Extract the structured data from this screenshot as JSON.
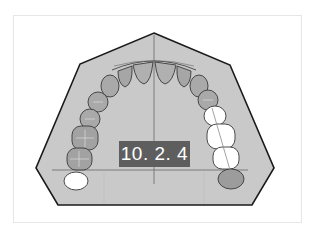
{
  "diagram": {
    "label": "10. 2. 4",
    "colors": {
      "palate_fill": "#c9c9c9",
      "outline": "#1a1a1a",
      "tooth_fill": "#a9a9a9",
      "tooth_highlight": "#d3d3d3",
      "tooth_missing": "#ffffff",
      "midline": "#7a7a7a",
      "label_bg": "#5e5e5e",
      "label_text": "#ffffff"
    },
    "teeth": {
      "left": [
        "central-incisor",
        "lateral-incisor",
        "canine",
        "first-premolar",
        "second-premolar",
        "first-molar",
        "second-molar",
        "third-molar-missing"
      ],
      "right": [
        "central-incisor",
        "lateral-incisor",
        "canine",
        "first-premolar",
        "second-premolar-missing",
        "first-molar-missing",
        "second-molar-missing",
        "third-molar"
      ]
    }
  }
}
